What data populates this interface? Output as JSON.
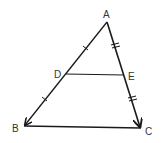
{
  "diagram": {
    "type": "geometry-triangle",
    "points": {
      "A": {
        "label": "A",
        "x": 107,
        "y": 22
      },
      "B": {
        "label": "B",
        "x": 24,
        "y": 126
      },
      "C": {
        "label": "C",
        "x": 141,
        "y": 128
      },
      "D": {
        "label": "D",
        "x": 66,
        "y": 74
      },
      "E": {
        "label": "E",
        "x": 124,
        "y": 75
      }
    },
    "segments": [
      {
        "from": "A",
        "to": "B",
        "arrow_at": "B",
        "tick_marks": "single",
        "ticks_on": [
          "AD",
          "DB"
        ]
      },
      {
        "from": "A",
        "to": "C",
        "arrow_at": "C",
        "tick_marks": "double",
        "ticks_on": [
          "AE",
          "EC"
        ]
      },
      {
        "from": "B",
        "to": "C"
      },
      {
        "from": "D",
        "to": "E"
      }
    ],
    "line_color": "#1a1a1a"
  }
}
